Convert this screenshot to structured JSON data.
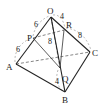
{
  "diagram": {
    "type": "tetrahedron",
    "points": {
      "O": {
        "label": "O",
        "x": 51,
        "y": 17
      },
      "A": {
        "label": "A",
        "x": 16,
        "y": 64
      },
      "B": {
        "label": "B",
        "x": 65,
        "y": 92
      },
      "C": {
        "label": "C",
        "x": 90,
        "y": 52
      },
      "P": {
        "label": "P",
        "x": 33,
        "y": 38
      },
      "Q": {
        "label": "Q",
        "x": 60,
        "y": 68
      },
      "R": {
        "label": "R",
        "x": 64,
        "y": 30
      }
    },
    "lengths": {
      "OP": "6",
      "PA": "6",
      "OR": "4",
      "RC": "8",
      "OQ": "8",
      "QB": "4"
    },
    "colors": {
      "line": "#222222",
      "dashed": "#555555",
      "background": "#ffffff"
    }
  }
}
